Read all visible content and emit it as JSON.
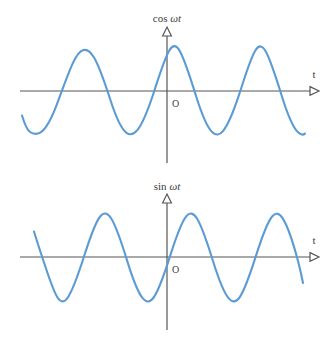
{
  "figure": {
    "background_color": "#ffffff",
    "axis_color": "#555555",
    "curve_color": "#5b9bd5",
    "text_color": "#3d3d3d"
  },
  "panels": {
    "top": {
      "name": "cosine-panel",
      "vertical_axis_label_prefix": "cos ",
      "vertical_axis_label_omega": "ω",
      "vertical_axis_label_t": "t",
      "vertical_axis_label_full": "cos ωt",
      "horizontal_axis_label": "t",
      "origin_label": "O"
    },
    "bottom": {
      "name": "sine-panel",
      "vertical_axis_label_prefix": "sin ",
      "vertical_axis_label_omega": "ω",
      "vertical_axis_label_t": "t",
      "vertical_axis_label_full": "sin ωt",
      "horizontal_axis_label": "t",
      "origin_label": "O"
    }
  },
  "chart_data": [
    {
      "type": "line",
      "name": "cosine-wave",
      "title": "cos ωt",
      "xlabel": "t",
      "ylabel": "cos ωt",
      "function": "cos",
      "amplitude": 1,
      "period_px": 85,
      "phase": "peak at origin",
      "ylim": [
        -1,
        1
      ],
      "grid": false,
      "legend": "none",
      "axis_pixels": {
        "x_axis_y": 91,
        "origin_x": 167,
        "x_axis_start": 20,
        "x_axis_end": 313,
        "y_axis_top": 30,
        "y_axis_bottom": 163,
        "amplitude_px": 43
      },
      "features": {
        "peaks_x_px": [
          82,
          167,
          252
        ],
        "troughs_x_px": [
          40,
          124,
          209,
          294
        ],
        "zero_crossings_x_px": [
          61,
          103,
          146,
          188,
          230,
          273
        ],
        "curve_start_x_px": 22,
        "curve_end_x_px": 305
      },
      "x": [
        -2.0,
        -1.75,
        -1.5,
        -1.25,
        -1.0,
        -0.75,
        -0.5,
        -0.25,
        0.0,
        0.25,
        0.5,
        0.75,
        1.0,
        1.25,
        1.5,
        1.75
      ],
      "values": [
        1.0,
        0.0,
        -1.0,
        0.0,
        1.0,
        0.0,
        -1.0,
        0.0,
        1.0,
        0.0,
        -1.0,
        0.0,
        1.0,
        0.0,
        -1.0,
        0.0
      ]
    },
    {
      "type": "line",
      "name": "sine-wave",
      "title": "sin ωt",
      "xlabel": "t",
      "ylabel": "sin ωt",
      "function": "sin",
      "amplitude": 1,
      "period_px": 85,
      "phase": "zero rising at origin",
      "ylim": [
        -1,
        1
      ],
      "grid": false,
      "legend": "none",
      "axis_pixels": {
        "x_axis_y": 257,
        "origin_x": 167,
        "x_axis_start": 20,
        "x_axis_end": 313,
        "y_axis_top": 196,
        "y_axis_bottom": 330,
        "amplitude_px": 43
      },
      "features": {
        "peaks_x_px": [
          104,
          188,
          273
        ],
        "troughs_x_px": [
          61,
          146,
          230
        ],
        "zero_crossings_x_px": [
          40,
          82,
          125,
          167,
          209,
          252,
          294
        ],
        "curve_start_x_px": 34,
        "curve_end_x_px": 303
      },
      "x": [
        -1.5,
        -1.25,
        -1.0,
        -0.75,
        -0.5,
        -0.25,
        0.0,
        0.25,
        0.5,
        0.75,
        1.0,
        1.25,
        1.5
      ],
      "values": [
        0.0,
        -1.0,
        0.0,
        1.0,
        0.0,
        -1.0,
        0.0,
        1.0,
        0.0,
        -1.0,
        0.0,
        1.0,
        0.0
      ]
    }
  ]
}
